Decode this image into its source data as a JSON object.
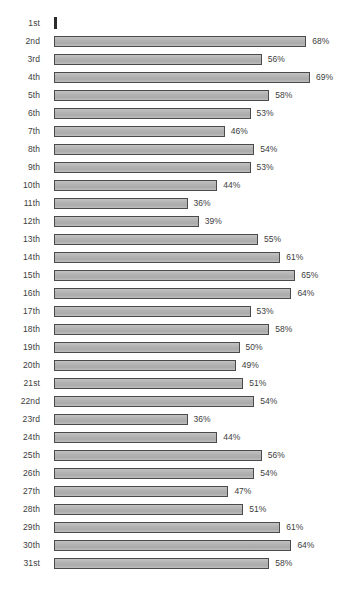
{
  "chart_data": {
    "type": "bar",
    "orientation": "horizontal",
    "title": "",
    "xlabel": "",
    "ylabel": "",
    "xlim": [
      0,
      69
    ],
    "grid": false,
    "legend": null,
    "value_suffix": "%",
    "categories": [
      "1st",
      "2nd",
      "3rd",
      "4th",
      "5th",
      "6th",
      "7th",
      "8th",
      "9th",
      "10th",
      "11th",
      "12th",
      "13th",
      "14th",
      "15th",
      "16th",
      "17th",
      "18th",
      "19th",
      "20th",
      "21st",
      "22nd",
      "23rd",
      "24th",
      "25th",
      "26th",
      "27th",
      "28th",
      "29th",
      "30th",
      "31st"
    ],
    "values": [
      0,
      68,
      56,
      69,
      58,
      53,
      46,
      54,
      53,
      44,
      36,
      39,
      55,
      61,
      65,
      64,
      53,
      58,
      50,
      49,
      51,
      54,
      36,
      44,
      56,
      54,
      47,
      51,
      61,
      64,
      58
    ],
    "labels": [
      "",
      "68%",
      "56%",
      "69%",
      "58%",
      "53%",
      "46%",
      "54%",
      "53%",
      "44%",
      "36%",
      "39%",
      "55%",
      "61%",
      "65%",
      "64%",
      "53%",
      "58%",
      "50%",
      "49%",
      "51%",
      "54%",
      "36%",
      "44%",
      "56%",
      "54%",
      "47%",
      "51%",
      "61%",
      "64%",
      "58%"
    ],
    "colors": {
      "bar_fill": "#b4b4b4",
      "bar_border": "#4a4a4a",
      "text": "#3d3d3d",
      "background": "#ffffff"
    }
  }
}
